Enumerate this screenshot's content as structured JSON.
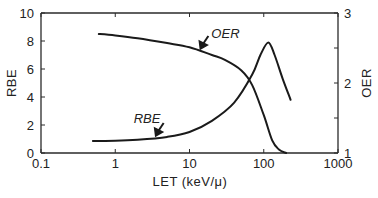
{
  "chart_data": {
    "type": "line",
    "title": "",
    "xlabel": "LET (keV/μ)",
    "ylabel": "RBE",
    "y2label": "OER",
    "xscale": "log",
    "xlim": [
      0.1,
      1000
    ],
    "ylim": [
      0,
      10
    ],
    "y2lim": [
      1,
      3
    ],
    "grid": false,
    "x_ticks": [
      0.1,
      1,
      10,
      100,
      1000
    ],
    "x_tick_labels": [
      "0.1",
      "1",
      "10",
      "100",
      "1000"
    ],
    "y_ticks": [
      0,
      2,
      4,
      6,
      8,
      10
    ],
    "y_tick_labels": [
      "0",
      "2",
      "4",
      "6",
      "8",
      "10"
    ],
    "y2_ticks": [
      1,
      1.5,
      2,
      2.5,
      3
    ],
    "y2_tick_labels": [
      "1",
      "",
      "2",
      "",
      "3"
    ],
    "series": [
      {
        "name": "OER",
        "axis": "right",
        "x": [
          0.6,
          1,
          2,
          5,
          10,
          20,
          30,
          50,
          70,
          100,
          130,
          160,
          200
        ],
        "y": [
          2.7,
          2.68,
          2.64,
          2.57,
          2.51,
          2.4,
          2.33,
          2.18,
          1.97,
          1.54,
          1.18,
          1.05,
          1.0
        ]
      },
      {
        "name": "RBE",
        "axis": "left",
        "x": [
          0.5,
          1,
          2,
          5,
          10,
          20,
          40,
          70,
          90,
          115,
          140,
          180,
          230
        ],
        "y": [
          0.86,
          0.88,
          0.95,
          1.15,
          1.5,
          2.3,
          3.6,
          5.6,
          7.0,
          7.9,
          7.0,
          5.3,
          3.8
        ]
      }
    ],
    "annotations": [
      {
        "text": "OER",
        "points_to": "OER",
        "at_x": 14
      },
      {
        "text": "RBE",
        "points_to": "RBE",
        "at_x": 3.5
      }
    ]
  }
}
